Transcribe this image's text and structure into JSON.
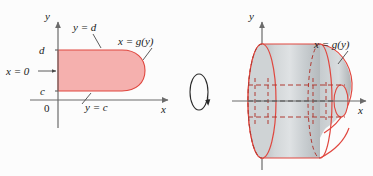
{
  "figure": {
    "background_color": "#fcfcfc",
    "region_fill": "#f5b0ae",
    "region_stroke": "#e0473f",
    "solid_fill": "#c8ccce",
    "solid_stroke": "#e0473f",
    "axis_color": "#6b6b6b",
    "leader_color": "#4a4a4a",
    "dashed_color": "#b03a33"
  },
  "left_panel": {
    "name": "plane-region",
    "axes": {
      "y_axis_label": "y",
      "x_axis_label": "x",
      "origin_label": "0"
    },
    "ticks": {
      "upper_y": "d",
      "lower_y": "c"
    },
    "labels": {
      "top_curve": "y = d",
      "right_curve": "x = g(y)",
      "bottom_curve": "y = c",
      "left_edge": "x = 0"
    }
  },
  "rotation": {
    "name": "rotation-arrow",
    "description": "revolve about the x-axis"
  },
  "right_panel": {
    "name": "solid-of-revolution",
    "axes": {
      "y_axis_label": "y",
      "x_axis_label": "x"
    },
    "labels": {
      "surface": "x = g(y)"
    }
  }
}
